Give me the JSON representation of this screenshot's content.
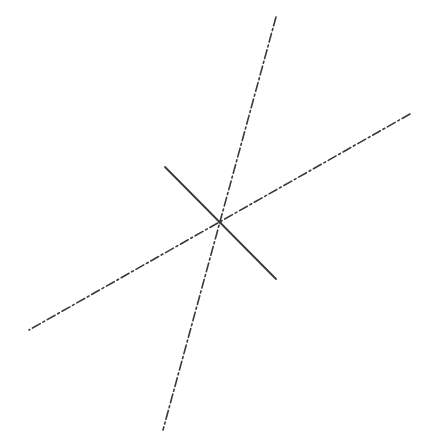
{
  "diagram": {
    "width": 429,
    "height": 448,
    "background": "#ffffff",
    "stroke_color": "#3a3a3a",
    "intersection": {
      "x": 220,
      "y": 222
    },
    "lines": [
      {
        "id": "steep-axis-line",
        "style": "dash-dot",
        "x1": 276,
        "y1": 17,
        "x2": 163,
        "y2": 430,
        "width": 1.6,
        "dasharray": "9 3 2 3"
      },
      {
        "id": "shallow-axis-line",
        "style": "dash-dot",
        "x1": 410,
        "y1": 114,
        "x2": 29,
        "y2": 330,
        "width": 1.6,
        "dasharray": "9 3 2 3"
      },
      {
        "id": "solid-normal-line",
        "style": "solid",
        "x1": 165,
        "y1": 167,
        "x2": 276,
        "y2": 279,
        "width": 1.8,
        "dasharray": ""
      }
    ]
  }
}
